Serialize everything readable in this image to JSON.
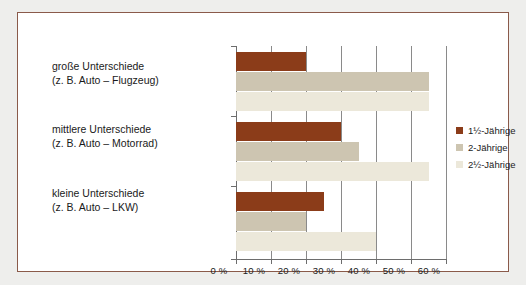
{
  "chart_data": {
    "type": "bar",
    "orientation": "horizontal",
    "title": "",
    "subtitle": "",
    "xlabel": "",
    "ylabel": "",
    "xlim": [
      0,
      60
    ],
    "xticks": [
      0,
      10,
      20,
      30,
      40,
      50,
      60
    ],
    "xtick_labels": [
      "0 %",
      "10 %",
      "20 %",
      "30 %",
      "40 %",
      "50 %",
      "60 %"
    ],
    "grid": true,
    "legend_position": "right",
    "categories": [
      "große Unterschiede\n(z. B. Auto – Flugzeug)",
      "mittlere Unterschiede\n(z. B. Auto – Motorrad)",
      "kleine Unterschiede\n(z. B. Auto – LKW)"
    ],
    "category_lines": [
      {
        "line1": "große Unterschiede",
        "line2": "(z. B. Auto – Flugzeug)"
      },
      {
        "line1": "mittlere Unterschiede",
        "line2": "(z. B. Auto – Motorrad)"
      },
      {
        "line1": "kleine Unterschiede",
        "line2": "(z. B. Auto – LKW)"
      }
    ],
    "series": [
      {
        "name": "1½-Jährige",
        "color": "#8b3c19",
        "values": [
          20,
          30,
          25
        ]
      },
      {
        "name": "2-Jährige",
        "color": "#cdc5b1",
        "values": [
          55,
          35,
          20
        ]
      },
      {
        "name": "2½-Jährige",
        "color": "#ece8da",
        "values": [
          55,
          55,
          40
        ]
      }
    ]
  },
  "legend": {
    "items": [
      {
        "label": "1½-Jährige"
      },
      {
        "label": "2-Jährige"
      },
      {
        "label": "2½-Jährige"
      }
    ]
  },
  "colors": {
    "series_1": "#8b3c19",
    "series_2": "#cdc5b1",
    "series_3": "#ece8da",
    "frame_border": "#8a5a4a",
    "page_background": "#eeeeec",
    "plot_background": "#ffffff",
    "axis": "#6d6d6d",
    "text": "#1a1a1a"
  }
}
